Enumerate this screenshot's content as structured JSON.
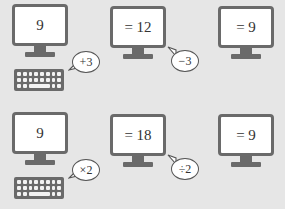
{
  "colors": {
    "background": "#e6e6e6",
    "monitor_frame": "#6a6a6a",
    "screen": "#ffffff",
    "text": "#333333"
  },
  "rows": [
    {
      "start": "9",
      "op1": "+3",
      "middle": "= 12",
      "op2": "−3",
      "result": "= 9"
    },
    {
      "start": "9",
      "op1": "×2",
      "middle": "= 18",
      "op2": "÷2",
      "result": "= 9"
    }
  ],
  "icons": [
    "monitor-icon",
    "keyboard-icon",
    "speech-bubble-icon"
  ]
}
